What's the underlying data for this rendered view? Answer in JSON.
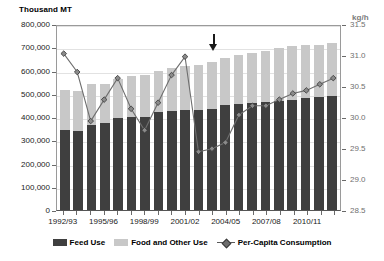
{
  "chart_data": {
    "type": "bar",
    "title": "",
    "subtitle": "",
    "xlabel": "",
    "ylabel": "Thousand MT",
    "y2label": "kg/h",
    "ylim": [
      0,
      800000
    ],
    "y2lim": [
      28.5,
      31.5
    ],
    "grid": true,
    "legend_position": "bottom",
    "categories": [
      "1992/93",
      "1993/94",
      "1994/95",
      "1995/96",
      "1996/97",
      "1997/98",
      "1998/99",
      "1999/00",
      "2000/01",
      "2001/02",
      "2002/03",
      "2003/04",
      "2004/05",
      "2005/06",
      "2006/07",
      "2007/08",
      "2008/09",
      "2009/10",
      "2010/11",
      "2011/12",
      "2012/13"
    ],
    "x_tick_labels": [
      "1992/93",
      "1995/96",
      "1998/99",
      "2001/02",
      "2004/05",
      "2007/08",
      "2010/11"
    ],
    "x_tick_indices": [
      0,
      3,
      6,
      9,
      12,
      15,
      18
    ],
    "y_tick_labels": [
      "0",
      "100,000",
      "200,000",
      "300,000",
      "400,000",
      "500,000",
      "600,000",
      "700,000",
      "800,000"
    ],
    "y_tick_values": [
      0,
      100000,
      200000,
      300000,
      400000,
      500000,
      600000,
      700000,
      800000
    ],
    "y2_tick_labels": [
      "28.5",
      "29.0",
      "29.5",
      "30.0",
      "30.5",
      "31.0",
      "31.5"
    ],
    "y2_tick_values": [
      28.5,
      29.0,
      29.5,
      30.0,
      30.5,
      31.0,
      31.5
    ],
    "series": [
      {
        "name": "Feed Use",
        "type": "bar-stack-bottom",
        "color": "#3f3f3f",
        "axis": "left",
        "values": [
          345000,
          340000,
          365000,
          375000,
          395000,
          400000,
          400000,
          420000,
          425000,
          430000,
          430000,
          435000,
          450000,
          455000,
          460000,
          465000,
          470000,
          475000,
          480000,
          485000,
          490000
        ]
      },
      {
        "name": "Food and Other Use",
        "type": "bar-stack-top",
        "color": "#c8c8c8",
        "axis": "left",
        "values": [
          170000,
          170000,
          175000,
          165000,
          170000,
          175000,
          180000,
          180000,
          185000,
          190000,
          195000,
          200000,
          205000,
          210000,
          215000,
          220000,
          225000,
          230000,
          230000,
          225000,
          230000
        ]
      },
      {
        "name": "Per-Capita Consumption",
        "type": "line",
        "color": "#6e6e6e",
        "marker": "diamond",
        "axis": "right",
        "values": [
          31.05,
          30.75,
          29.95,
          30.3,
          30.65,
          30.15,
          29.8,
          30.25,
          30.7,
          31.0,
          29.45,
          29.5,
          29.6,
          30.05,
          30.2,
          30.2,
          30.3,
          30.4,
          30.45,
          30.55,
          30.65
        ]
      }
    ],
    "annotations": [
      {
        "name": "down-arrow",
        "symbol": "↓",
        "category_index": 11,
        "note": ""
      }
    ],
    "legend_entries": [
      {
        "label": "Feed Use",
        "swatch": "dark-square"
      },
      {
        "label": "Food and Other Use",
        "swatch": "light-square"
      },
      {
        "label": "Per-Capita Consumption",
        "swatch": "line-diamond"
      }
    ],
    "colors": {
      "feed_use": "#3f3f3f",
      "food_other_use": "#c8c8c8",
      "per_capita_line": "#6e6e6e",
      "grid": "#e2e2e2",
      "axis": "#9a9a9a",
      "right_axis_text": "#6f6f6f"
    }
  }
}
